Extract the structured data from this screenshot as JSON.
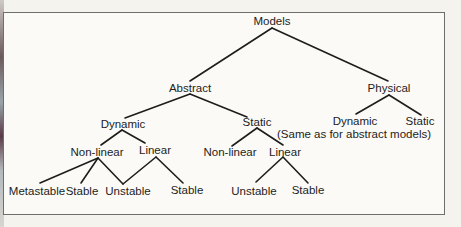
{
  "diagram": {
    "type": "tree",
    "root": "Models",
    "nodes": {
      "models": "Models",
      "abstract": "Abstract",
      "physical": "Physical",
      "abstract_dynamic": "Dynamic",
      "abstract_static": "Static",
      "dyn_nonlinear": "Non-linear",
      "dyn_linear": "Linear",
      "dyn_nl_metastable": "Metastable",
      "dyn_nl_stable": "Stable",
      "dyn_shared_unstable": "Unstable",
      "dyn_lin_stable": "Stable",
      "static_nonlinear": "Non-linear",
      "static_linear": "Linear",
      "static_lin_unstable": "Unstable",
      "static_lin_stable": "Stable",
      "physical_dynamic": "Dynamic",
      "physical_static": "Static",
      "physical_note": "(Same as for abstract models)"
    },
    "edges": [
      [
        "Models",
        "Abstract"
      ],
      [
        "Models",
        "Physical"
      ],
      [
        "Abstract",
        "Dynamic"
      ],
      [
        "Abstract",
        "Static"
      ],
      [
        "Dynamic",
        "Non-linear"
      ],
      [
        "Dynamic",
        "Linear"
      ],
      [
        "Non-linear",
        "Metastable"
      ],
      [
        "Non-linear",
        "Stable"
      ],
      [
        "Non-linear",
        "Unstable"
      ],
      [
        "Linear",
        "Unstable"
      ],
      [
        "Linear",
        "Stable"
      ],
      [
        "Static",
        "Non-linear"
      ],
      [
        "Static",
        "Linear"
      ],
      [
        "Linear (static)",
        "Unstable"
      ],
      [
        "Linear (static)",
        "Stable"
      ],
      [
        "Physical",
        "Dynamic"
      ],
      [
        "Physical",
        "Static"
      ]
    ],
    "colors": {
      "line": "#1d1d1d",
      "text": "#1d1d1d",
      "frame": "#6e6e6e",
      "background": "#fbfaf6"
    }
  }
}
